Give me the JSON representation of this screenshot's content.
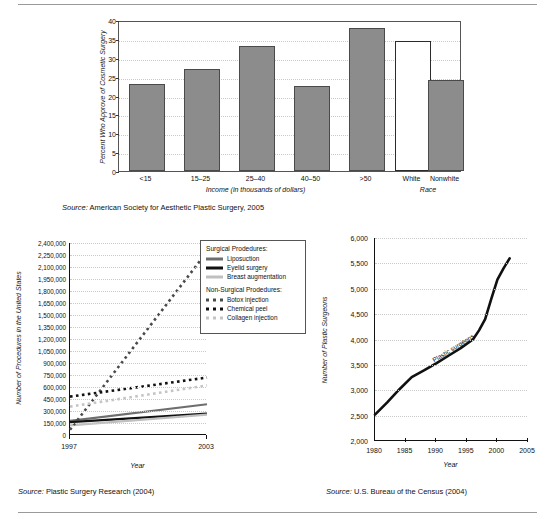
{
  "page": {
    "background": "#ffffff",
    "rule_color": "#9a9a9a"
  },
  "charts": [
    {
      "id": "approval-bar-chart",
      "source": "Source: American Society for Aesthetic Plastic Surgery, 2005",
      "source_prefix": "Source:",
      "source_rest": " American Society for Aesthetic Plastic Surgery, 2005",
      "xlabel_primary": "Income (in thousands of dollars)",
      "xlabel_secondary": "Race"
    },
    {
      "id": "procedures-line-chart",
      "source_prefix": "Source:",
      "source_rest": " Plastic Surgery Research (2004)",
      "xlabel": "Year"
    },
    {
      "id": "surgeons-line-chart",
      "source_prefix": "Source:",
      "source_rest": " U.S. Bureau of the Census (2004)",
      "xlabel": "Year"
    }
  ],
  "chart_data": [
    {
      "type": "bar",
      "id": "approval-bar-chart",
      "title": "",
      "xlabel": "Income (in thousands of dollars)",
      "xlabel2": "Race",
      "ylabel": "Percent Who Approve of Cosmetic Surgery",
      "ylim": [
        0,
        40
      ],
      "yticks": [
        0,
        5,
        10,
        15,
        20,
        25,
        30,
        35,
        40
      ],
      "grid": true,
      "categories": [
        "<15",
        "15–25",
        "25–40",
        "40–50",
        ">50",
        "White",
        "Nonwhite"
      ],
      "values": [
        23,
        27,
        33,
        22.5,
        38,
        34.5,
        24
      ],
      "bar_colors": [
        "#8c8c8c",
        "#8c8c8c",
        "#8c8c8c",
        "#8c8c8c",
        "#8c8c8c",
        "#ffffff",
        "#8c8c8c"
      ],
      "gap_after_index": 4,
      "source": "Source: American Society for Aesthetic Plastic Surgery, 2005"
    },
    {
      "type": "line",
      "id": "procedures-line-chart",
      "title": "",
      "xlabel": "Year",
      "ylabel": "Number of Procedures in the United States",
      "x": [
        1997,
        2003
      ],
      "xticks": [
        1997,
        2003
      ],
      "ylim": [
        0,
        2400000
      ],
      "yticks": [
        0,
        150000,
        300000,
        450000,
        600000,
        750000,
        900000,
        1050000,
        1200000,
        1350000,
        1500000,
        1650000,
        1800000,
        1950000,
        2100000,
        2250000,
        2400000
      ],
      "ytick_labels": [
        "0",
        "150,000",
        "300,000",
        "450,000",
        "600,000",
        "750,000",
        "900,000",
        "1,050,000",
        "1,200,000",
        "1,350,000",
        "1,500,000",
        "1,650,000",
        "1,800,000",
        "1,950,000",
        "2,100,000",
        "2,250,000",
        "2,400,000"
      ],
      "grid": true,
      "legend_position": "right-outside",
      "legend_groups": [
        {
          "heading": "Surgical Prodedures:",
          "entries": [
            {
              "name": "Liposuction",
              "style": "solid",
              "color": "#6e6e6e",
              "width": 3
            },
            {
              "name": "Eyelid surgery",
              "style": "solid",
              "color": "#111111",
              "width": 3
            },
            {
              "name": "Breast augmentation",
              "style": "solid",
              "color": "#bfbfbf",
              "width": 3
            }
          ]
        },
        {
          "heading": "Non-Surgical Prodedures:",
          "entries": [
            {
              "name": "Botox injection",
              "style": "dotted",
              "color": "#4a4a4a",
              "width": 3
            },
            {
              "name": "Chemical peel",
              "style": "dotted",
              "color": "#111111",
              "width": 3
            },
            {
              "name": "Collagen injection",
              "style": "dotted",
              "color": "#c4c4c4",
              "width": 3
            }
          ]
        }
      ],
      "series": [
        {
          "name": "Liposuction",
          "group": "Surgical",
          "style": "solid",
          "color": "#6e6e6e",
          "values": [
            176000,
            384000
          ]
        },
        {
          "name": "Eyelid surgery",
          "group": "Surgical",
          "style": "solid",
          "color": "#111111",
          "values": [
            160000,
            267000
          ]
        },
        {
          "name": "Breast augmentation",
          "group": "Surgical",
          "style": "solid",
          "color": "#bfbfbf",
          "values": [
            120000,
            254000
          ]
        },
        {
          "name": "Botox injection",
          "group": "Non-Surgical",
          "style": "dotted",
          "color": "#4a4a4a",
          "values": [
            65000,
            2290000
          ]
        },
        {
          "name": "Chemical peel",
          "group": "Non-Surgical",
          "style": "dotted",
          "color": "#111111",
          "values": [
            480000,
            718000
          ]
        },
        {
          "name": "Collagen injection",
          "group": "Non-Surgical",
          "style": "dotted",
          "color": "#c4c4c4",
          "values": [
            355000,
            620000
          ]
        }
      ],
      "source": "Source: Plastic Surgery Research (2004)"
    },
    {
      "type": "line",
      "id": "surgeons-line-chart",
      "title": "",
      "xlabel": "Year",
      "ylabel": "Number of Plastic Surgeons",
      "series_annotation": "Plastic surgeons",
      "xlim": [
        1980,
        2005
      ],
      "xticks": [
        1980,
        1985,
        1990,
        1995,
        2000,
        2005
      ],
      "ylim": [
        2000,
        6000
      ],
      "yticks": [
        2000,
        2500,
        3000,
        3500,
        4000,
        4500,
        5000,
        5500,
        6000
      ],
      "ytick_labels": [
        "2,000",
        "2,500",
        "3,000",
        "3,500",
        "4,000",
        "4,500",
        "5,000",
        "5,500",
        "6,000"
      ],
      "grid": true,
      "x": [
        1980,
        1982,
        1984,
        1986,
        1988,
        1990,
        1992,
        1994,
        1996,
        1997,
        1998,
        1999,
        2000,
        2001,
        2002
      ],
      "values": [
        2520,
        2760,
        3020,
        3260,
        3390,
        3530,
        3680,
        3830,
        4000,
        4180,
        4400,
        4800,
        5180,
        5400,
        5600
      ],
      "source": "Source: U.S. Bureau of the Census (2004)"
    }
  ]
}
